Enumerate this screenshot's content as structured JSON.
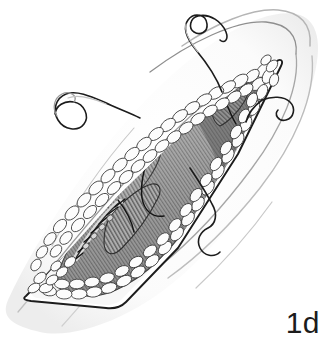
{
  "figure": {
    "caption": "1d",
    "background_color": "#ffffff",
    "ink_color": "#1c1c1c",
    "medium": "grayscale line drawing"
  },
  "anatomy": {
    "skin": {
      "label": "skin-surface",
      "contour_color": "#9a9a9a",
      "shade_color": "#f2f2f2"
    },
    "incision": {
      "label": "lenticular-incision-margin",
      "outline_color": "#1c1c1c",
      "orientation": "oblique, upper-right to lower-left"
    },
    "fat": {
      "label": "subcutaneous-fat-lobules",
      "fill_color": "#fbfbfb",
      "outline_color": "#3a3a3a",
      "description": "cobblestone lobules lining the wound edge"
    },
    "muscle": {
      "label": "striated-muscle-bed",
      "light_color": "#bdbdbd",
      "dark_color": "#4f4f4f",
      "description": "parallel striated fibers filling the wound base"
    },
    "muscle_flaps": [
      {
        "label": "upper-right-muscle-tag",
        "tone": "#6e6e6e"
      },
      {
        "label": "mid-left-muscle-flap",
        "tone": "#8a8a8a"
      },
      {
        "label": "lower-center-muscle-flap",
        "tone": "#7d7d7d"
      }
    ]
  },
  "sutures": {
    "thread_color": "#1c1c1c",
    "knot_color": "#cfcfcf",
    "repairs": [
      {
        "label": "primary-muscle-repair-suture-line",
        "stitch_type": "interrupted",
        "stitch_count": 9,
        "location": "central diagonal, upper muscle belly"
      },
      {
        "label": "secondary-muscle-repair-suture-line",
        "stitch_type": "interrupted",
        "stitch_count": 7,
        "location": "lower-left muscle belly"
      }
    ],
    "free_strands": [
      {
        "label": "upper-right-free-suture",
        "tail": "curled-loop"
      },
      {
        "label": "upper-left-free-suture",
        "tail": "curled-loop"
      },
      {
        "label": "right-lateral-free-suture",
        "tail": "hooked"
      },
      {
        "label": "lower-right-free-suture",
        "tail": "wavy"
      }
    ]
  }
}
